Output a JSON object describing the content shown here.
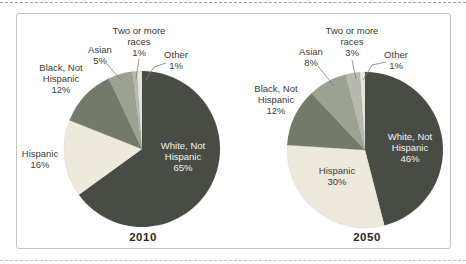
{
  "page": {
    "background": "#ffffff",
    "figure_border_color": "#c3c3be",
    "text_color": "#3b3b38",
    "inside_label_color": "#f3f3ef"
  },
  "chart_data": [
    {
      "type": "pie",
      "year_label": "2010",
      "start_angle_deg": 0,
      "direction": "clockwise",
      "legend_position": "callouts",
      "slices": [
        {
          "label": "White, Not Hispanic",
          "value_pct": 65,
          "color": "#484c44"
        },
        {
          "label": "Hispanic",
          "value_pct": 16,
          "color": "#edeadb"
        },
        {
          "label": "Black, Not Hispanic",
          "value_pct": 12,
          "color": "#747a6b"
        },
        {
          "label": "Asian",
          "value_pct": 5,
          "color": "#9ba292"
        },
        {
          "label": "Two or more races",
          "value_pct": 1,
          "color": "#b6b9ad"
        },
        {
          "label": "Other",
          "value_pct": 1,
          "color": "#e6e6df"
        }
      ],
      "callouts": {
        "white": "White, Not\nHispanic\n65%",
        "hispanic": "Hispanic\n16%",
        "black": "Black, Not\nHispanic\n12%",
        "asian": "Asian\n5%",
        "two_or_more": "Two or more\nraces\n1%",
        "other": "Other\n1%"
      }
    },
    {
      "type": "pie",
      "year_label": "2050",
      "start_angle_deg": 0,
      "direction": "clockwise",
      "legend_position": "callouts",
      "slices": [
        {
          "label": "White, Not Hispanic",
          "value_pct": 46,
          "color": "#484c44"
        },
        {
          "label": "Hispanic",
          "value_pct": 30,
          "color": "#edeadb"
        },
        {
          "label": "Black, Not Hispanic",
          "value_pct": 12,
          "color": "#747a6b"
        },
        {
          "label": "Asian",
          "value_pct": 8,
          "color": "#9ba292"
        },
        {
          "label": "Two or more races",
          "value_pct": 3,
          "color": "#b6b9ad"
        },
        {
          "label": "Other",
          "value_pct": 1,
          "color": "#e6e6df"
        }
      ],
      "callouts": {
        "white": "White, Not\nHispanic\n46%",
        "hispanic": "Hispanic\n30%",
        "black": "Black, Not\nHispanic\n12%",
        "asian": "Asian\n8%",
        "two_or_more": "Two or more\nraces\n3%",
        "other": "Other\n1%"
      }
    }
  ]
}
